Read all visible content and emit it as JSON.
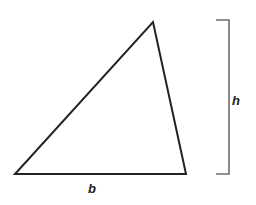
{
  "diagram": {
    "shape": {
      "type": "triangle",
      "vertices": [
        [
          15,
          174
        ],
        [
          186,
          174
        ],
        [
          153,
          22
        ]
      ],
      "stroke": "#222222",
      "stroke_width": 2
    },
    "height_bracket": {
      "top_y": 20,
      "bottom_y": 174,
      "x": 229,
      "tick_left_x": 216,
      "stroke": "#6e6e6e"
    },
    "labels": {
      "base": "b",
      "height": "h"
    }
  }
}
